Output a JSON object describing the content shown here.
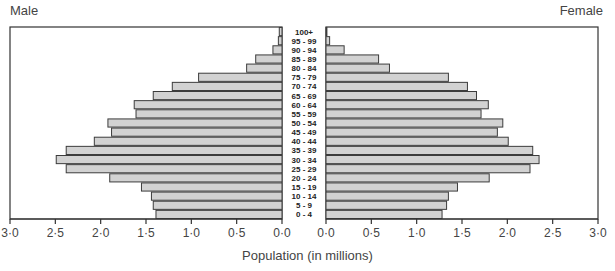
{
  "chart_data": {
    "type": "bar",
    "subtype": "population-pyramid",
    "title": "",
    "xlabel": "Population (in millions)",
    "ylabel": "",
    "left_label": "Male",
    "right_label": "Female",
    "categories": [
      "100+",
      "95 - 99",
      "90 - 94",
      "85 - 89",
      "80 - 84",
      "75 - 79",
      "70 - 74",
      "65 - 69",
      "60 - 64",
      "55 - 59",
      "50 - 54",
      "45 - 49",
      "40 - 44",
      "35 - 39",
      "30 - 34",
      "25 - 29",
      "20 - 24",
      "15 - 19",
      "10 - 14",
      "5 - 9",
      "0 - 4"
    ],
    "series": [
      {
        "name": "Male",
        "values": [
          0.03,
          0.04,
          0.1,
          0.29,
          0.39,
          0.92,
          1.21,
          1.42,
          1.63,
          1.61,
          1.92,
          1.88,
          2.07,
          2.38,
          2.49,
          2.38,
          1.9,
          1.55,
          1.44,
          1.42,
          1.39
        ]
      },
      {
        "name": "Female",
        "values": [
          0.01,
          0.04,
          0.2,
          0.58,
          0.7,
          1.35,
          1.56,
          1.66,
          1.79,
          1.71,
          1.95,
          1.89,
          2.01,
          2.28,
          2.35,
          2.25,
          1.8,
          1.45,
          1.35,
          1.33,
          1.28
        ]
      }
    ],
    "xticks": [
      "3·0",
      "2·5",
      "2·0",
      "1·5",
      "1·0",
      "0·5",
      "0·0"
    ],
    "xticks_right": [
      "0·0",
      "0·5",
      "1·0",
      "1·5",
      "2·0",
      "2·5",
      "3·0"
    ],
    "xlim": [
      0,
      3.0
    ],
    "grid": false,
    "legend": "none",
    "colors": {
      "bar_fill": "#d2d2d2",
      "bar_stroke": "#3c3c3c",
      "axis": "#333333"
    }
  }
}
